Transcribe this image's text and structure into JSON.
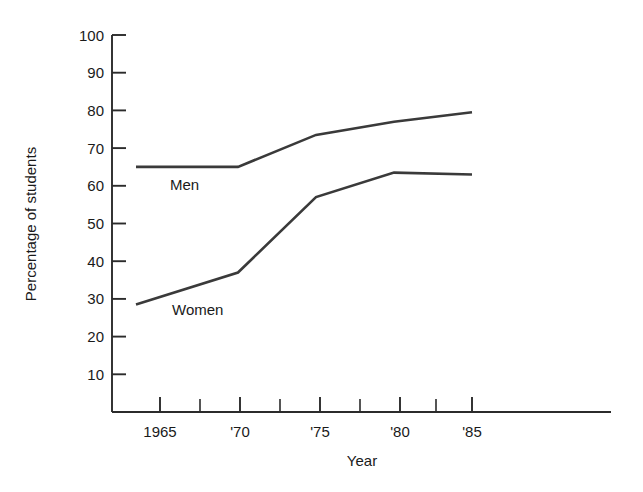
{
  "chart_data": {
    "type": "line",
    "title": "",
    "xlabel": "Year",
    "ylabel": "Percentage of students",
    "x": [
      1965,
      1970,
      1975,
      1980,
      1985
    ],
    "categories": [
      "1965",
      "'70",
      "'75",
      "'80",
      "'85"
    ],
    "series": [
      {
        "name": "Men",
        "values": [
          65,
          65,
          73.5,
          77,
          79.5
        ]
      },
      {
        "name": "Women",
        "values": [
          28.5,
          37,
          57,
          63.5,
          63
        ]
      }
    ],
    "ylim": [
      0,
      100
    ],
    "xlim": [
      1965,
      1985
    ],
    "ytick_labels": [
      "100",
      "90",
      "80",
      "70",
      "60",
      "50",
      "40",
      "30",
      "20",
      "10"
    ],
    "ytick_values": [
      100,
      90,
      80,
      70,
      60,
      50,
      40,
      30,
      20,
      10
    ],
    "xtick_labels": [
      "1965",
      "'70",
      "'75",
      "'80",
      "'85"
    ],
    "xtick_values": [
      1965,
      1970,
      1975,
      1980,
      1985
    ],
    "x_minor_tick_values": [
      1967.5,
      1972.5,
      1977.5,
      1982.5
    ],
    "grid": false,
    "legend": "inline-labels",
    "annotations": [
      {
        "text": "Men",
        "x": 1966.4,
        "y": 59.5
      },
      {
        "text": "Women",
        "x": 1967.0,
        "y": 27.0
      }
    ],
    "line_color": "#3a3a3a",
    "axis_color": "#2b2b2b",
    "background_color": "#ffffff"
  }
}
